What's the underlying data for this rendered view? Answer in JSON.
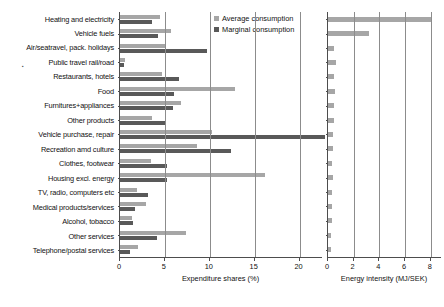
{
  "chart_data": {
    "type": "bar",
    "title": "",
    "orientation": "horizontal",
    "grid": true,
    "legend": {
      "position": "top-center",
      "entries": [
        {
          "name": "Average consumption",
          "color": "#a6a6a6"
        },
        {
          "name": "Marginal consumption",
          "color": "#595959"
        }
      ]
    },
    "categories": [
      "Heating and electricity",
      "Vehicle fuels",
      "Air/seatravel, pack. holidays",
      "Public travel rail/road",
      "Restaurants, hotels",
      "Food",
      "Furnitures+appliances",
      "Other products",
      "Vehicle purchase, repair",
      "Recreation amd culture",
      "Clothes, footwear",
      "Housing excl. energy",
      "TV, radio, computers etc",
      "Medical products/services",
      "Alcohol, tobacco",
      "Other services",
      "Telephone/postal services"
    ],
    "panels": [
      {
        "id": "expenditure-shares",
        "xlabel": "Expenditure shares (%)",
        "xlim": [
          0,
          22.5
        ],
        "xticks": [
          0,
          5,
          10,
          15,
          20
        ],
        "xticklabels": [
          "0",
          "5",
          "10",
          "15",
          "20"
        ],
        "series": [
          {
            "name": "Average consumption",
            "color": "#a6a6a6",
            "values": [
              4.5,
              5.7,
              5.0,
              0.6,
              4.7,
              12.8,
              6.8,
              3.6,
              10.3,
              8.6,
              3.4,
              16.1,
              1.9,
              2.9,
              1.3,
              7.4,
              2.0
            ]
          },
          {
            "name": "Marginal consumption",
            "color": "#595959",
            "values": [
              3.6,
              4.2,
              9.7,
              0.4,
              6.6,
              6.0,
              5.9,
              5.1,
              22.8,
              12.4,
              5.2,
              5.2,
              3.1,
              1.7,
              1.4,
              4.1,
              1.1
            ]
          }
        ]
      },
      {
        "id": "energy-intensity",
        "xlabel": "Energy intensity (MJ/SEK)",
        "xlim": [
          0,
          8.8
        ],
        "xticks": [
          0,
          2,
          4,
          6,
          8
        ],
        "xticklabels": [
          "0",
          "2",
          "4",
          "6",
          "8"
        ],
        "series": [
          {
            "name": "Average consumption",
            "color": "#a6a6a6",
            "values": [
              8.0,
              3.2,
              0.45,
              0.62,
              0.5,
              0.55,
              0.5,
              0.45,
              0.42,
              0.38,
              0.35,
              0.38,
              0.3,
              0.3,
              0.28,
              0.25,
              0.22
            ]
          }
        ]
      }
    ]
  }
}
